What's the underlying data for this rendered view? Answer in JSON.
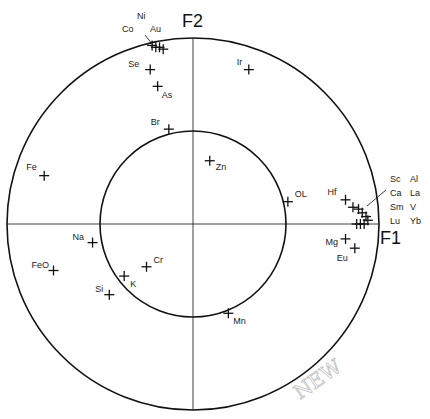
{
  "chart_data": {
    "type": "scatter",
    "subtype": "pca-correlation-circle",
    "title": "",
    "xlabel": "F1",
    "ylabel": "F2",
    "xlim": [
      -1,
      1
    ],
    "ylim": [
      -1,
      1
    ],
    "grid": false,
    "legend": null,
    "circles": [
      {
        "name": "unit-circle",
        "radius": 1.0
      },
      {
        "name": "half-circle",
        "radius": 0.5
      }
    ],
    "marker": "+",
    "points": [
      {
        "label": "Co",
        "x": -0.22,
        "y": 0.96
      },
      {
        "label": "Ni",
        "x": -0.2,
        "y": 0.95
      },
      {
        "label": "Au",
        "x": -0.18,
        "y": 0.95
      },
      {
        "label": "",
        "x": -0.16,
        "y": 0.94
      },
      {
        "label": "Se",
        "x": -0.23,
        "y": 0.83
      },
      {
        "label": "As",
        "x": -0.19,
        "y": 0.74
      },
      {
        "label": "Ir",
        "x": 0.3,
        "y": 0.83
      },
      {
        "label": "Br",
        "x": -0.13,
        "y": 0.51
      },
      {
        "label": "Zn",
        "x": 0.09,
        "y": 0.34
      },
      {
        "label": "OL",
        "x": 0.51,
        "y": 0.12
      },
      {
        "label": "Fe",
        "x": -0.8,
        "y": 0.26
      },
      {
        "label": "Na",
        "x": -0.54,
        "y": -0.1
      },
      {
        "label": "FeO",
        "x": -0.75,
        "y": -0.25
      },
      {
        "label": "Cr",
        "x": -0.25,
        "y": -0.23
      },
      {
        "label": "K",
        "x": -0.37,
        "y": -0.28
      },
      {
        "label": "Si",
        "x": -0.45,
        "y": -0.38
      },
      {
        "label": "Mn",
        "x": 0.19,
        "y": -0.48
      },
      {
        "label": "Hf",
        "x": 0.82,
        "y": 0.13
      },
      {
        "label": "Sc",
        "x": 0.86,
        "y": 0.09
      },
      {
        "label": "Al",
        "x": 0.89,
        "y": 0.08
      },
      {
        "label": "Ca",
        "x": 0.91,
        "y": 0.06
      },
      {
        "label": "La",
        "x": 0.93,
        "y": 0.04
      },
      {
        "label": "Sm",
        "x": 0.94,
        "y": 0.02
      },
      {
        "label": "V",
        "x": 0.88,
        "y": 0.0
      },
      {
        "label": "Lu",
        "x": 0.9,
        "y": 0.0
      },
      {
        "label": "Yb",
        "x": 0.92,
        "y": 0.0
      },
      {
        "label": "Mg",
        "x": 0.82,
        "y": -0.08
      },
      {
        "label": "Eu",
        "x": 0.87,
        "y": -0.13
      }
    ],
    "annotations": [
      {
        "text": "Co",
        "note": "leader line group with Ni, Au"
      },
      {
        "text": "Sc Al / Ca La / Sm V / Lu Yb",
        "note": "grouped label for tight cluster near F1 axis with leader line"
      }
    ]
  },
  "labels": {
    "f1": "F1",
    "f2": "F2",
    "group_top": {
      "co": "Co",
      "ni": "Ni",
      "au": "Au"
    },
    "group_right": [
      [
        "Sc",
        "Al"
      ],
      [
        "Ca",
        "La"
      ],
      [
        "Sm",
        "V"
      ],
      [
        "Lu",
        "Yb"
      ]
    ],
    "handwritten": "NEW"
  },
  "layout": {
    "cx": 193,
    "cy": 224,
    "r_outer": 186,
    "r_inner": 93,
    "line_color": "#111111"
  }
}
